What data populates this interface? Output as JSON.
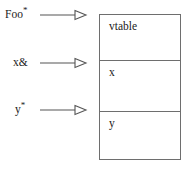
{
  "diagram": {
    "canvas": {
      "width": 192,
      "height": 170,
      "background": "#ffffff"
    },
    "stroke_color": "#6e6e6e",
    "text_color": "#1a1a1a",
    "pointers": [
      {
        "id": "foo",
        "base": "Foo",
        "suffix": "*",
        "label": "Foo*",
        "arrow": "open-triangle-arrow",
        "target": "vtable"
      },
      {
        "id": "x",
        "base": "x",
        "suffix": "&",
        "label": "x&",
        "arrow": "open-triangle-arrow",
        "target": "x"
      },
      {
        "id": "y",
        "base": "y",
        "suffix": "*",
        "label": "y*",
        "arrow": "open-triangle-arrow",
        "target": "y"
      }
    ],
    "object_box": {
      "cells": [
        {
          "id": "vtable",
          "label": "vtable"
        },
        {
          "id": "x",
          "label": "x"
        },
        {
          "id": "y",
          "label": "y"
        }
      ]
    }
  }
}
